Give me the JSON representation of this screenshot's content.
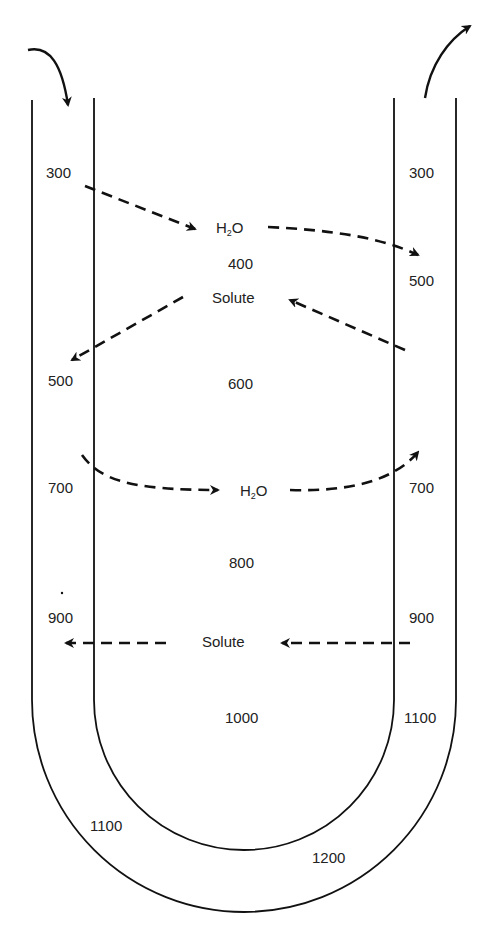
{
  "diagram": {
    "type": "countercurrent-loop-of-henle",
    "stroke_color": "#111111",
    "descending_limb_labels": [
      "300",
      "500",
      "700",
      "900",
      "1100"
    ],
    "interstitial_labels": [
      "400",
      "600",
      "800",
      "1000",
      "1200"
    ],
    "ascending_limb_labels": [
      "300",
      "500",
      "700",
      "900",
      "1100"
    ],
    "flow_labels": {
      "h2o_top": {
        "main": "H",
        "sub": "2",
        "tail": "O"
      },
      "solute_top": "Solute",
      "h2o_mid": {
        "main": "H",
        "sub": "2",
        "tail": "O"
      },
      "solute_bottom": "Solute"
    }
  }
}
